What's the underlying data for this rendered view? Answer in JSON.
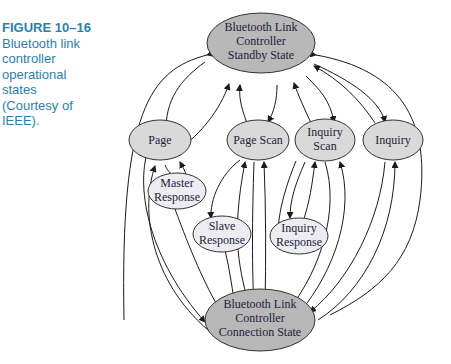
{
  "caption": {
    "figure_label": "FIGURE 10–16",
    "lines": [
      "Bluetooth link",
      "controller",
      "operational",
      "states",
      "(Courtesy of",
      "IEEE)."
    ]
  },
  "nodes": {
    "standby": [
      "Bluetooth Link",
      "Controller",
      "Standby State"
    ],
    "page": [
      "Page"
    ],
    "page_scan": [
      "Page Scan"
    ],
    "inquiry_scan": [
      "Inquiry",
      "Scan"
    ],
    "inquiry": [
      "Inquiry"
    ],
    "master_response": [
      "Master",
      "Response"
    ],
    "slave_response": [
      "Slave",
      "Response"
    ],
    "inquiry_response": [
      "Inquiry",
      "Response"
    ],
    "connection": [
      "Bluetooth Link",
      "Controller",
      "Connection State"
    ]
  },
  "colors": {
    "major_state": "#b8b8b8",
    "substate": "#d9d9d9",
    "response_state": "#ececf2",
    "caption": "#2a7fb0"
  }
}
